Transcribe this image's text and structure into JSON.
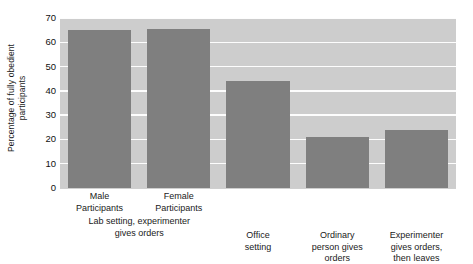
{
  "chart_data": {
    "type": "bar",
    "title": "",
    "subtitle": "",
    "xlabel": "",
    "ylabel_line1": "Percentage of fully obedient",
    "ylabel_line2": "participants",
    "ylim": [
      0,
      70
    ],
    "yticks": [
      0,
      10,
      20,
      30,
      40,
      50,
      60,
      70
    ],
    "ytick_labels": [
      "0",
      "10",
      "20",
      "30",
      "40",
      "50",
      "60",
      "70"
    ],
    "grid": true,
    "legend": "none",
    "categories": [
      "Male Participants",
      "Female Participants",
      "Office setting",
      "Ordinary person gives orders",
      "Experimenter gives orders, then leaves"
    ],
    "values": [
      65,
      65.5,
      44,
      21,
      24
    ],
    "bar_color": "#7f7f7f",
    "plot_background": "#cdcdcd",
    "gridline_color": "#fdfdfd",
    "bars": [
      {
        "label_line1": "Male",
        "label_line2": "Participants",
        "value": 65
      },
      {
        "label_line1": "Female",
        "label_line2": "Participants",
        "value": 65.5
      },
      {
        "label_line1": "",
        "label_line2": "",
        "value": 44
      },
      {
        "label_line1": "",
        "label_line2": "",
        "value": 21
      },
      {
        "label_line1": "",
        "label_line2": "",
        "value": 24
      }
    ],
    "group_labels": [
      {
        "line1": "Lab setting, experimenter",
        "line2": "gives orders",
        "line3": ""
      },
      {
        "line1": "Office",
        "line2": "setting",
        "line3": ""
      },
      {
        "line1": "Ordinary",
        "line2": "person gives",
        "line3": "orders"
      },
      {
        "line1": "Experimenter",
        "line2": "gives orders,",
        "line3": "then leaves"
      }
    ]
  }
}
